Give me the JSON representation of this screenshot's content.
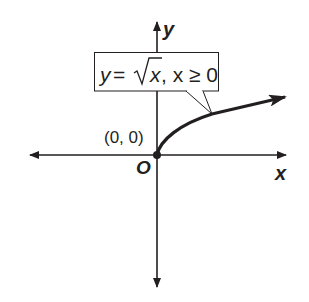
{
  "diagram": {
    "axes": {
      "x_label": "x",
      "y_label": "y",
      "origin_label": "O"
    },
    "point": {
      "label": "(0, 0)"
    },
    "callout": {
      "y_var": "y",
      "equals": "=",
      "radicand": "x",
      "condition": ", x ≥ 0",
      "full_text": "y = √x, x ≥ 0"
    },
    "colors": {
      "ink": "#231f20",
      "background": "#ffffff"
    }
  }
}
